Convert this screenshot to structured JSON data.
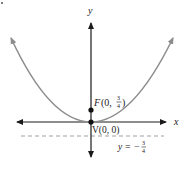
{
  "figure": {
    "type": "parabola-diagram",
    "axis_labels": {
      "x": "x",
      "y": "y"
    },
    "focus": {
      "letter": "F",
      "label_open": "(0, ",
      "frac_num": "3",
      "frac_den": "4",
      "label_close": ")"
    },
    "vertex": {
      "label": "V(0, 0)"
    },
    "directrix": {
      "label_lhs": "y = −",
      "frac_num": "3",
      "frac_den": "4"
    },
    "colors": {
      "axis": "#1a1a1a",
      "curve": "#8c8c8c",
      "directrix": "#a0a0a0",
      "point": "#111111"
    }
  }
}
